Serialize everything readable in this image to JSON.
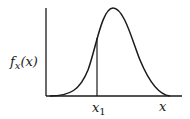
{
  "diagram": {
    "type": "probability density curve",
    "y_axis_label": {
      "func": "f",
      "subscript": "x",
      "arg": "(x)"
    },
    "x_axis_label": "x",
    "marker": {
      "symbol": "x",
      "subscript": "1"
    },
    "colors": {
      "ink": "#1a1a1a",
      "background": "#ffffff"
    }
  }
}
